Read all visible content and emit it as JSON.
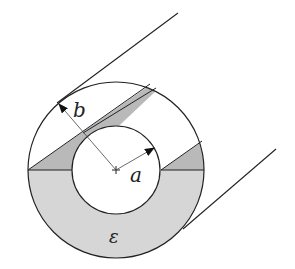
{
  "diagram": {
    "labels": {
      "outer_radius": "b",
      "inner_radius": "a",
      "dielectric": "ε"
    },
    "colors": {
      "background": "#ffffff",
      "stroke": "#222222",
      "dielectric_fill": "#d6d6d6",
      "wedge_fill": "#b9b9b9"
    },
    "geometry": {
      "center": [
        116,
        170
      ],
      "inner_radius_px": 44,
      "outer_radius_px": 88
    }
  }
}
